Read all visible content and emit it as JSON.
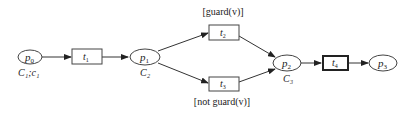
{
  "diagram": {
    "type": "petri-net",
    "places": [
      {
        "id": "p0",
        "label": "p",
        "sub": "0",
        "annotation": "C₁;c₁"
      },
      {
        "id": "p1",
        "label": "p",
        "sub": "1",
        "annotation": "C₂"
      },
      {
        "id": "p2",
        "label": "p",
        "sub": "2",
        "annotation": "C₃"
      },
      {
        "id": "p3",
        "label": "p",
        "sub": "3",
        "annotation": ""
      }
    ],
    "transitions": [
      {
        "id": "t1",
        "label": "t",
        "sub": "1"
      },
      {
        "id": "t2",
        "label": "t",
        "sub": "2",
        "guard": "[guard(v)]"
      },
      {
        "id": "t3",
        "label": "t",
        "sub": "3",
        "guard": "[not guard(v)]"
      },
      {
        "id": "t4",
        "label": "t",
        "sub": "4",
        "emphasized": true
      }
    ],
    "arcs": [
      {
        "from": "p0",
        "to": "t1"
      },
      {
        "from": "t1",
        "to": "p1"
      },
      {
        "from": "p1",
        "to": "t2"
      },
      {
        "from": "p1",
        "to": "t3"
      },
      {
        "from": "t2",
        "to": "p2"
      },
      {
        "from": "t3",
        "to": "p2"
      },
      {
        "from": "p2",
        "to": "t4"
      },
      {
        "from": "t4",
        "to": "p3"
      }
    ]
  }
}
